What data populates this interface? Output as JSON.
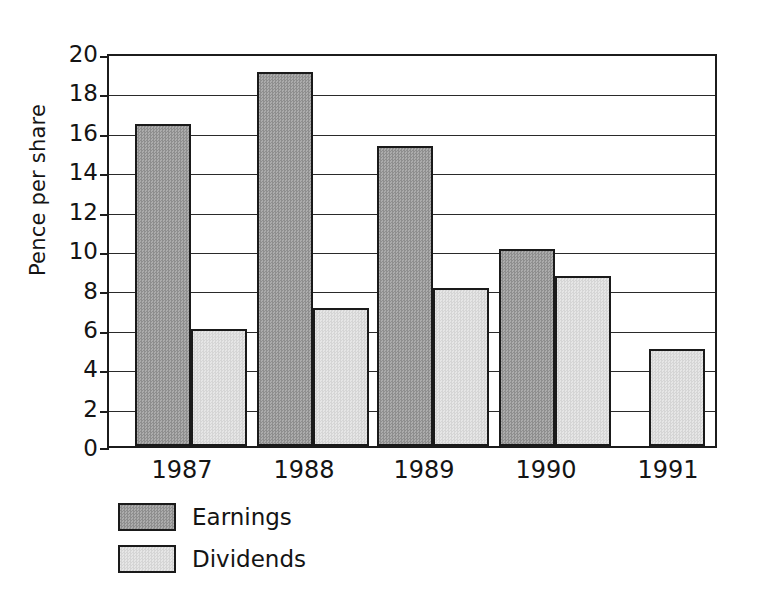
{
  "chart_data": {
    "type": "bar",
    "title": "",
    "subtitle": "",
    "xlabel": "",
    "ylabel": "Pence per share",
    "categories": [
      "1987",
      "1988",
      "1989",
      "1990",
      "1991"
    ],
    "series": [
      {
        "name": "Earnings",
        "color": "#9d9d9d",
        "values": [
          16.5,
          19.2,
          15.4,
          10.1,
          null
        ]
      },
      {
        "name": "Dividends",
        "color": "#dddddd",
        "values": [
          6.0,
          7.1,
          8.1,
          8.7,
          5.0
        ]
      }
    ],
    "ylim": [
      0,
      20
    ],
    "ytick_step": 2,
    "yticks": [
      "20",
      "18",
      "16",
      "14",
      "12",
      "10",
      "8",
      "6",
      "4",
      "2",
      "0"
    ],
    "grid": true,
    "grid_axis": "y",
    "legend_position": "below-left",
    "legend_entries": [
      "Earnings",
      "Dividends"
    ],
    "bar_border_color": "#1a1a1a",
    "axis_color": "#1c1c1c",
    "background_color": "#ffffff"
  }
}
